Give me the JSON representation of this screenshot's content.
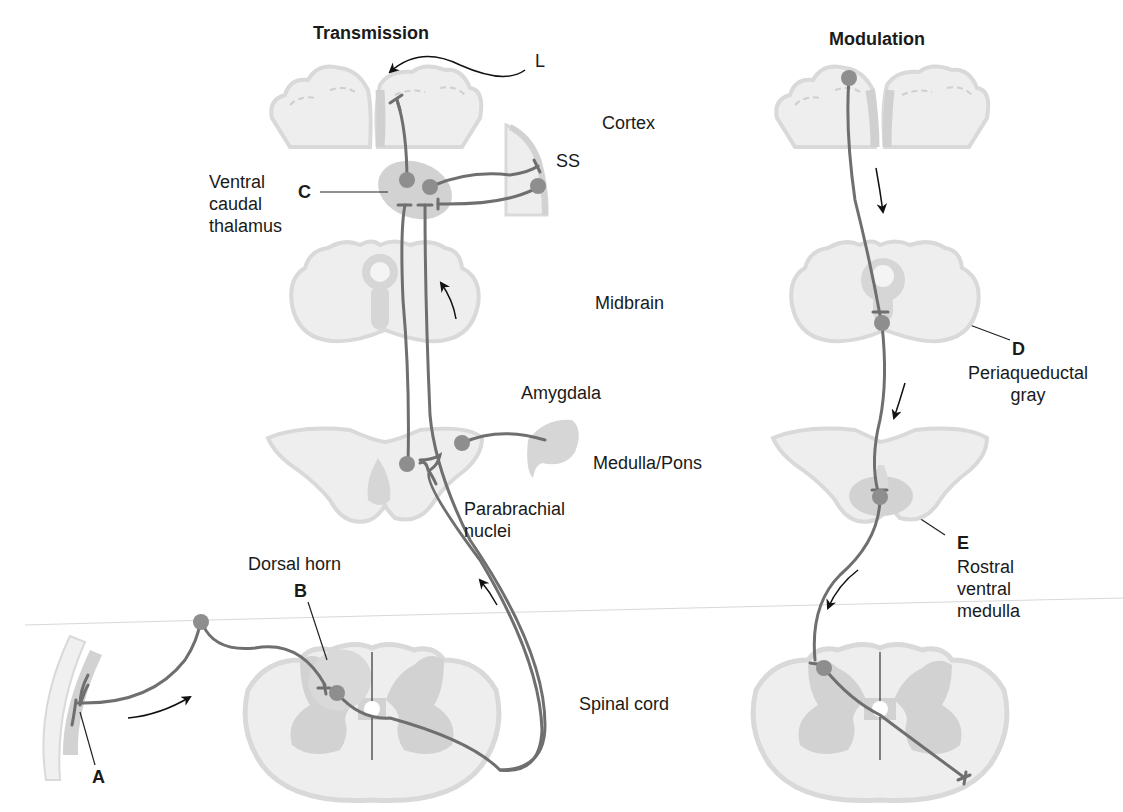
{
  "colors": {
    "tissue_light": "#eeeeee",
    "tissue_outline": "#d9d9d9",
    "gray_matter": "#cfcfcf",
    "nucleus": "#cdcdcd",
    "neuron_body": "#8e8e8e",
    "axon": "#6f6f6f",
    "arrow": "#111111",
    "text": "#1a1a1a"
  },
  "panels": {
    "transmission": {
      "title": "Transmission"
    },
    "modulation": {
      "title": "Modulation"
    }
  },
  "levels": {
    "cortex": "Cortex",
    "midbrain": "Midbrain",
    "medulla_pons": "Medulla/Pons",
    "spinal_cord": "Spinal cord"
  },
  "structures": {
    "ventral_caudal_thalamus": "Ventral\ncaudal\nthalamus",
    "ss": "SS",
    "l": "L",
    "amygdala": "Amygdala",
    "parabrachial_nuclei": "Parabrachial\nnuclei",
    "dorsal_horn": "Dorsal horn",
    "periaqueductal_gray": "Periaqueductal\ngray",
    "rostral_ventral_medulla": "Rostral\nventral\nmedulla"
  },
  "letters": {
    "a": "A",
    "b": "B",
    "c": "C",
    "d": "D",
    "e": "E"
  }
}
